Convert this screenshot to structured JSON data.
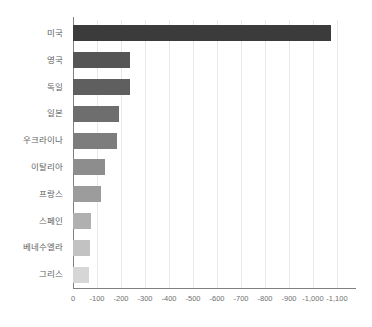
{
  "chart_data": {
    "type": "bar",
    "orientation": "horizontal",
    "title": "",
    "subtitle": "",
    "xlabel": "",
    "ylabel": "",
    "categories": [
      "미국",
      "영국",
      "독일",
      "일본",
      "우크라이나",
      "이탈리아",
      "프랑스",
      "스페인",
      "베네수엘라",
      "그리스"
    ],
    "values": [
      -1075,
      -237,
      -237,
      -192,
      -184,
      -133,
      -117,
      -73,
      -70,
      -68
    ],
    "bar_colors": [
      "#3b3b3b",
      "#555555",
      "#5f5f5f",
      "#6e6e6e",
      "#7d7d7d",
      "#8d8d8d",
      "#9c9c9c",
      "#b0b0b0",
      "#c2c2c2",
      "#d6d6d6"
    ],
    "xlim": [
      0,
      -1100
    ],
    "xticks": [
      0,
      -100,
      -200,
      -300,
      -400,
      -500,
      -600,
      -700,
      -800,
      -900,
      -1000,
      -1100
    ],
    "xtick_labels": [
      "0",
      "-100",
      "-200",
      "-300",
      "-400",
      "-500",
      "-600",
      "-700",
      "-800",
      "-900",
      "-1,000",
      "-1,100"
    ],
    "grid": true,
    "grid_axis": "x",
    "grid_color": "#e9e9e9",
    "legend": false,
    "axis_color": "#808080",
    "label_color": "#5f5f5f",
    "background": "#ffffff"
  }
}
